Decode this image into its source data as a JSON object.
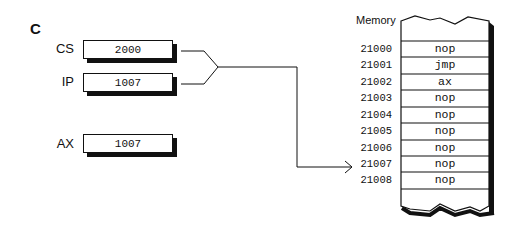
{
  "panel_label": "C",
  "registers": [
    {
      "name": "CS",
      "value": "2000"
    },
    {
      "name": "IP",
      "value": "1007"
    },
    {
      "name": "AX",
      "value": "1007"
    }
  ],
  "memory": {
    "title": "Memory",
    "rows": [
      {
        "address": "21000",
        "content": "nop"
      },
      {
        "address": "21001",
        "content": "jmp"
      },
      {
        "address": "21002",
        "content": "ax"
      },
      {
        "address": "21003",
        "content": "nop"
      },
      {
        "address": "21004",
        "content": "nop"
      },
      {
        "address": "21005",
        "content": "nop"
      },
      {
        "address": "21006",
        "content": "nop"
      },
      {
        "address": "21007",
        "content": "nop"
      },
      {
        "address": "21008",
        "content": "nop"
      }
    ],
    "pointed_address": "21007"
  },
  "colors": {
    "line": "#111111",
    "background": "#ffffff"
  }
}
